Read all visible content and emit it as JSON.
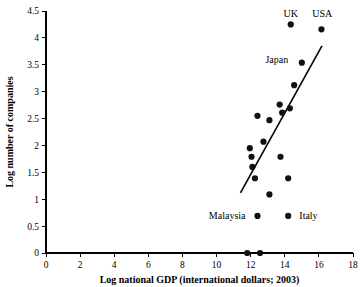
{
  "chart_data": {
    "type": "scatter",
    "title": "",
    "xlabel": "Log national GDP (international dollars; 2003)",
    "ylabel": "Log number of companies",
    "xlim": [
      0,
      18
    ],
    "ylim": [
      0,
      4.5
    ],
    "xticks": [
      "0",
      "2",
      "4",
      "6",
      "8",
      "10",
      "12",
      "14",
      "16",
      "18"
    ],
    "xtick_values": [
      0,
      2,
      4,
      6,
      8,
      10,
      12,
      14,
      16,
      18
    ],
    "yticks": [
      "0",
      "0.5",
      "1",
      "1.5",
      "2",
      "2.5",
      "3",
      "3.5",
      "4",
      "4.5"
    ],
    "ytick_values": [
      0,
      0.5,
      1,
      1.5,
      2,
      2.5,
      3,
      3.5,
      4,
      4.5
    ],
    "grid": false,
    "legend": "none",
    "marker_color": "#111111",
    "marker_radius": 3.1,
    "points": [
      {
        "x": 14.35,
        "y": 4.25,
        "label": "UK"
      },
      {
        "x": 16.15,
        "y": 4.16,
        "label": "USA"
      },
      {
        "x": 15.0,
        "y": 3.54,
        "label": "Japan"
      },
      {
        "x": 14.55,
        "y": 3.12,
        "label": ""
      },
      {
        "x": 13.7,
        "y": 2.76,
        "label": ""
      },
      {
        "x": 14.3,
        "y": 2.69,
        "label": ""
      },
      {
        "x": 13.85,
        "y": 2.61,
        "label": ""
      },
      {
        "x": 12.4,
        "y": 2.55,
        "label": ""
      },
      {
        "x": 13.1,
        "y": 2.47,
        "label": ""
      },
      {
        "x": 12.75,
        "y": 2.07,
        "label": ""
      },
      {
        "x": 11.95,
        "y": 1.95,
        "label": ""
      },
      {
        "x": 13.75,
        "y": 1.79,
        "label": ""
      },
      {
        "x": 12.05,
        "y": 1.79,
        "label": ""
      },
      {
        "x": 12.1,
        "y": 1.6,
        "label": ""
      },
      {
        "x": 14.2,
        "y": 1.39,
        "label": ""
      },
      {
        "x": 12.25,
        "y": 1.39,
        "label": ""
      },
      {
        "x": 13.1,
        "y": 1.09,
        "label": ""
      },
      {
        "x": 12.4,
        "y": 0.69,
        "label": "Malaysia"
      },
      {
        "x": 14.2,
        "y": 0.69,
        "label": "Italy"
      },
      {
        "x": 11.8,
        "y": 0.0,
        "label": ""
      },
      {
        "x": 12.55,
        "y": 0.0,
        "label": ""
      }
    ],
    "trend_line": {
      "x_start": 11.4,
      "y_start": 1.12,
      "x_end": 16.18,
      "y_end": 3.85
    },
    "annotations": [
      {
        "text": "UK",
        "x": 14.35,
        "y": 4.45,
        "anchor": "middle"
      },
      {
        "text": "USA",
        "x": 16.2,
        "y": 4.45,
        "anchor": "middle"
      },
      {
        "text": "Japan",
        "x": 14.55,
        "y": 3.6,
        "anchor": "end"
      },
      {
        "text": "Malaysia",
        "x": 12.05,
        "y": 0.69,
        "anchor": "end"
      },
      {
        "text": "Italy",
        "x": 14.5,
        "y": 0.69,
        "anchor": "start"
      }
    ]
  }
}
